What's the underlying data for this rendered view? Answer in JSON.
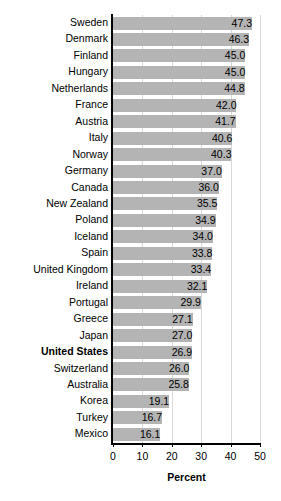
{
  "chart_data": {
    "type": "bar",
    "orientation": "horizontal",
    "title": "",
    "subtitle": "",
    "xlabel": "Percent",
    "ylabel": "",
    "xlim": [
      0,
      50
    ],
    "xticks": [
      0,
      10,
      20,
      30,
      40,
      50
    ],
    "xtick_labels": [
      "0",
      "10",
      "20",
      "30",
      "40",
      "50"
    ],
    "grid": true,
    "grid_axis": "x",
    "legend": false,
    "bar_color": "#b4b4b4",
    "axis_color": "#000000",
    "gridline_color": "#d8d8d8",
    "highlight_category": "United States",
    "categories": [
      "Sweden",
      "Denmark",
      "Finland",
      "Hungary",
      "Netherlands",
      "France",
      "Austria",
      "Italy",
      "Norway",
      "Germany",
      "Canada",
      "New Zealand",
      "Poland",
      "Iceland",
      "Spain",
      "United Kingdom",
      "Ireland",
      "Portugal",
      "Greece",
      "Japan",
      "United States",
      "Switzerland",
      "Australia",
      "Korea",
      "Turkey",
      "Mexico"
    ],
    "values": [
      47.3,
      46.3,
      45.0,
      45.0,
      44.8,
      42.0,
      41.7,
      40.6,
      40.3,
      37.0,
      36.0,
      35.5,
      34.9,
      34.0,
      33.8,
      33.4,
      32.1,
      29.9,
      27.1,
      27.0,
      26.9,
      26.0,
      25.8,
      19.1,
      16.7,
      16.1
    ],
    "value_labels": [
      "47.3",
      "46.3",
      "45.0",
      "45.0",
      "44.8",
      "42.0",
      "41.7",
      "40.6",
      "40.3",
      "37.0",
      "36.0",
      "35.5",
      "34.9",
      "34.0",
      "33.8",
      "33.4",
      "32.1",
      "29.9",
      "27.1",
      "27.0",
      "26.9",
      "26.0",
      "25.8",
      "19.1",
      "16.7",
      "16.1"
    ]
  }
}
